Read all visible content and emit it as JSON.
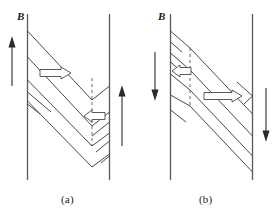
{
  "figure": {
    "width": 279,
    "height": 220,
    "background_color": "#ffffff",
    "line_color": "#3a3a3a",
    "arrow_fill": "#ffffff"
  },
  "panels": [
    {
      "id": "a",
      "caption": "(a)",
      "field_label": "B",
      "field_direction": "up",
      "field_arrows": [
        {
          "name": "field-arrow-left",
          "direction": "up"
        },
        {
          "name": "field-arrow-right",
          "direction": "up"
        }
      ],
      "motion_arrows": [
        {
          "name": "motion-arrow-upper",
          "direction": "right"
        },
        {
          "name": "motion-arrow-lower",
          "direction": "left"
        }
      ],
      "dashed_line": "vertical-dashed-boundary"
    },
    {
      "id": "b",
      "caption": "(b)",
      "field_label": "B",
      "field_direction": "down",
      "field_arrows": [
        {
          "name": "field-arrow-left",
          "direction": "down"
        },
        {
          "name": "field-arrow-right",
          "direction": "down"
        }
      ],
      "motion_arrows": [
        {
          "name": "motion-arrow-upper",
          "direction": "left"
        },
        {
          "name": "motion-arrow-lower",
          "direction": "right"
        }
      ],
      "dashed_line": "vertical-dashed-boundary"
    }
  ]
}
